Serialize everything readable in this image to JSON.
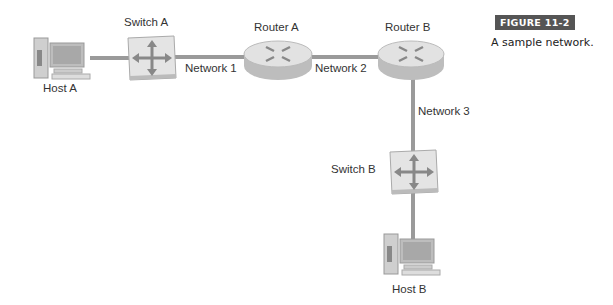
{
  "figure": {
    "badge": "FIGURE 11-2",
    "caption": "A sample network."
  },
  "nodes": {
    "host_a": {
      "label": "Host A",
      "type": "host"
    },
    "switch_a": {
      "label": "Switch A",
      "type": "switch"
    },
    "router_a": {
      "label": "Router A",
      "type": "router"
    },
    "router_b": {
      "label": "Router B",
      "type": "router"
    },
    "switch_b": {
      "label": "Switch B",
      "type": "switch"
    },
    "host_b": {
      "label": "Host B",
      "type": "host"
    }
  },
  "networks": {
    "n1": "Network 1",
    "n2": "Network 2",
    "n3": "Network 3"
  },
  "colors": {
    "link": "#9a9a9a",
    "badge_bg": "#555555",
    "device": "#d8d8d8"
  }
}
